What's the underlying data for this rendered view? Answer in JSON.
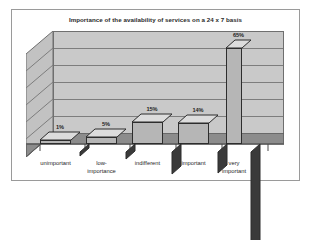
{
  "chart_data": {
    "type": "bar",
    "title": "Importance of the availability of services on a 24 x 7 basis",
    "xlabel": "",
    "ylabel": "",
    "categories": [
      "unimportant",
      "low-importance",
      "indifferent",
      "important",
      "very important"
    ],
    "category_lines": [
      [
        "unimportant"
      ],
      [
        "low-",
        "importance"
      ],
      [
        "indifferent"
      ],
      [
        "important"
      ],
      [
        "very",
        "important"
      ]
    ],
    "values": [
      1,
      5,
      15,
      14,
      65
    ],
    "value_labels": [
      "1%",
      "5%",
      "15%",
      "14%",
      "65%"
    ],
    "ylim": [
      0,
      70
    ],
    "grid": true,
    "gridline_count": 6,
    "legend": "none",
    "style": "3d-column",
    "colors": {
      "bar_front": "#b6b6b6",
      "bar_top": "#dcdcdc",
      "bar_side": "#3a3a3a",
      "bar_outline": "#2d2d2d",
      "back_wall": "#c9c9c9",
      "side_wall": "#c2c2c2",
      "floor": "#8c8c8c",
      "gridline": "#7d7d7d",
      "frame_border": "#9a9a9a",
      "title_text": "#2a2a2a",
      "label_text": "#1f1f1f",
      "background": "#ffffff"
    }
  }
}
